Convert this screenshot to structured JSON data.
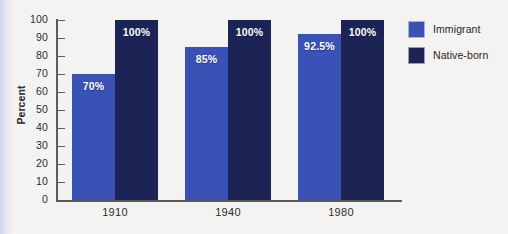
{
  "chart_data": {
    "type": "bar",
    "title": "",
    "xlabel": "",
    "ylabel": "Percent",
    "ylim": [
      0,
      100
    ],
    "yticks": [
      0,
      10,
      20,
      30,
      40,
      50,
      60,
      70,
      80,
      90,
      100
    ],
    "ytick_labels": [
      "0",
      "10",
      "20",
      "30",
      "40",
      "50",
      "60",
      "70",
      "80",
      "90",
      "100"
    ],
    "categories": [
      "1910",
      "1940",
      "1980"
    ],
    "grid": false,
    "legend_position": "right",
    "series": [
      {
        "name": "Immigrant",
        "color": "#3a52b5",
        "values": [
          70,
          85,
          92.5
        ],
        "labels": [
          "70%",
          "85%",
          "92.5%"
        ]
      },
      {
        "name": "Native-born",
        "color": "#1c2456",
        "values": [
          100,
          100,
          100
        ],
        "labels": [
          "100%",
          "100%",
          "100%"
        ]
      }
    ]
  },
  "legend": {
    "items": [
      {
        "label": "Immigrant",
        "swatch": "legend-swatch-immigrant"
      },
      {
        "label": "Native-born",
        "swatch": "legend-swatch-native-born"
      }
    ]
  },
  "axes": {
    "y_title": "Percent"
  },
  "colors": {
    "immigrant": "#3a52b5",
    "native_born": "#1c2456",
    "axis": "#5c5c5c",
    "text": "#2b2b2b",
    "background": "#f4f3f1",
    "label_text": "#ffffff"
  }
}
